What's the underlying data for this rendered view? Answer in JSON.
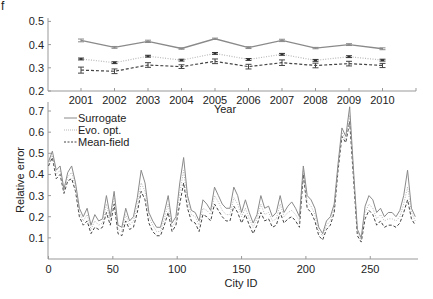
{
  "panel_letter": "f",
  "chart_data": [
    {
      "type": "line",
      "title": "",
      "xlabel": "Year",
      "ylabel": "",
      "ylim": [
        0.2,
        0.5
      ],
      "yticks": [
        "0.2",
        "0.3",
        "0.4",
        "0.5"
      ],
      "categories": [
        "2001",
        "2002",
        "2003",
        "2004",
        "2005",
        "2006",
        "2007",
        "2008",
        "2009",
        "2010"
      ],
      "grid": false,
      "error_bars": true,
      "series": [
        {
          "name": "Surrogate",
          "style": "solid",
          "color": "#8a8a8a",
          "values": [
            0.418,
            0.388,
            0.414,
            0.383,
            0.425,
            0.387,
            0.418,
            0.385,
            0.4,
            0.382
          ],
          "err": [
            0.006,
            0.004,
            0.005,
            0.003,
            0.003,
            0.004,
            0.005,
            0.003,
            0.004,
            0.004
          ]
        },
        {
          "name": "Evo. opt.",
          "style": "dotted",
          "color": "#b8b8b8",
          "values": [
            0.338,
            0.322,
            0.35,
            0.333,
            0.362,
            0.336,
            0.358,
            0.332,
            0.348,
            0.333
          ],
          "err": [
            0.004,
            0.004,
            0.004,
            0.004,
            0.004,
            0.004,
            0.004,
            0.004,
            0.004,
            0.004
          ]
        },
        {
          "name": "Mean-field",
          "style": "dashed",
          "color": "#444444",
          "values": [
            0.29,
            0.285,
            0.312,
            0.305,
            0.328,
            0.305,
            0.322,
            0.31,
            0.318,
            0.31
          ],
          "err": [
            0.013,
            0.01,
            0.01,
            0.008,
            0.01,
            0.01,
            0.012,
            0.01,
            0.01,
            0.009
          ]
        }
      ]
    },
    {
      "type": "line",
      "title": "",
      "xlabel": "City ID",
      "ylabel": "Relative error",
      "xlim": [
        0,
        287
      ],
      "ylim": [
        0,
        0.75
      ],
      "xticks": [
        "0",
        "50",
        "100",
        "150",
        "200",
        "250"
      ],
      "yticks": [
        "0.1",
        "0.2",
        "0.3",
        "0.4",
        "0.5",
        "0.6",
        "0.7"
      ],
      "grid": false,
      "legend_position": "upper left",
      "x": [
        0,
        3,
        6,
        9,
        12,
        15,
        18,
        21,
        24,
        27,
        30,
        33,
        36,
        39,
        42,
        45,
        48,
        51,
        54,
        57,
        60,
        63,
        66,
        69,
        72,
        75,
        78,
        81,
        84,
        87,
        90,
        93,
        96,
        99,
        102,
        105,
        108,
        111,
        114,
        117,
        120,
        123,
        126,
        129,
        132,
        135,
        138,
        141,
        144,
        147,
        150,
        153,
        156,
        159,
        162,
        165,
        168,
        171,
        174,
        177,
        180,
        183,
        186,
        189,
        192,
        195,
        198,
        201,
        204,
        207,
        210,
        213,
        216,
        219,
        222,
        225,
        228,
        231,
        234,
        237,
        240,
        243,
        246,
        249,
        252,
        255,
        258,
        261,
        264,
        267,
        270,
        273,
        276,
        279,
        282,
        285
      ],
      "series": [
        {
          "name": "Surrogate",
          "style": "solid",
          "color": "#8a8a8a",
          "values": [
            0.46,
            0.51,
            0.42,
            0.44,
            0.33,
            0.41,
            0.44,
            0.36,
            0.24,
            0.2,
            0.24,
            0.16,
            0.21,
            0.18,
            0.19,
            0.3,
            0.2,
            0.32,
            0.16,
            0.15,
            0.24,
            0.18,
            0.2,
            0.29,
            0.42,
            0.36,
            0.22,
            0.18,
            0.15,
            0.15,
            0.22,
            0.3,
            0.17,
            0.2,
            0.36,
            0.48,
            0.3,
            0.23,
            0.22,
            0.18,
            0.28,
            0.26,
            0.23,
            0.34,
            0.3,
            0.26,
            0.24,
            0.24,
            0.34,
            0.3,
            0.22,
            0.28,
            0.22,
            0.17,
            0.21,
            0.3,
            0.24,
            0.25,
            0.2,
            0.22,
            0.3,
            0.22,
            0.25,
            0.27,
            0.24,
            0.2,
            0.44,
            0.3,
            0.28,
            0.24,
            0.15,
            0.12,
            0.18,
            0.2,
            0.26,
            0.45,
            0.62,
            0.58,
            0.72,
            0.42,
            0.14,
            0.1,
            0.25,
            0.3,
            0.28,
            0.22,
            0.24,
            0.2,
            0.22,
            0.22,
            0.2,
            0.23,
            0.3,
            0.42,
            0.24,
            0.2
          ]
        },
        {
          "name": "Evo. opt.",
          "style": "dotted",
          "color": "#b8b8b8",
          "values": [
            0.45,
            0.49,
            0.4,
            0.42,
            0.32,
            0.39,
            0.41,
            0.34,
            0.22,
            0.18,
            0.21,
            0.14,
            0.18,
            0.16,
            0.17,
            0.26,
            0.18,
            0.29,
            0.14,
            0.13,
            0.21,
            0.16,
            0.18,
            0.25,
            0.36,
            0.32,
            0.2,
            0.16,
            0.13,
            0.13,
            0.19,
            0.26,
            0.15,
            0.18,
            0.31,
            0.42,
            0.27,
            0.21,
            0.2,
            0.16,
            0.24,
            0.23,
            0.21,
            0.3,
            0.27,
            0.23,
            0.21,
            0.21,
            0.29,
            0.26,
            0.2,
            0.24,
            0.19,
            0.15,
            0.19,
            0.26,
            0.21,
            0.22,
            0.18,
            0.19,
            0.26,
            0.2,
            0.22,
            0.23,
            0.21,
            0.18,
            0.42,
            0.27,
            0.25,
            0.21,
            0.13,
            0.11,
            0.16,
            0.18,
            0.24,
            0.44,
            0.6,
            0.56,
            0.68,
            0.4,
            0.13,
            0.09,
            0.22,
            0.26,
            0.24,
            0.19,
            0.21,
            0.18,
            0.19,
            0.19,
            0.18,
            0.2,
            0.26,
            0.34,
            0.22,
            0.18
          ]
        },
        {
          "name": "Mean-field",
          "style": "dashed",
          "color": "#444444",
          "values": [
            0.44,
            0.48,
            0.38,
            0.4,
            0.31,
            0.37,
            0.38,
            0.32,
            0.2,
            0.16,
            0.18,
            0.12,
            0.15,
            0.14,
            0.15,
            0.22,
            0.16,
            0.26,
            0.12,
            0.11,
            0.18,
            0.14,
            0.15,
            0.22,
            0.32,
            0.28,
            0.17,
            0.13,
            0.11,
            0.11,
            0.16,
            0.22,
            0.13,
            0.16,
            0.26,
            0.36,
            0.24,
            0.18,
            0.17,
            0.13,
            0.21,
            0.2,
            0.18,
            0.26,
            0.23,
            0.2,
            0.18,
            0.18,
            0.25,
            0.22,
            0.17,
            0.21,
            0.16,
            0.12,
            0.16,
            0.22,
            0.18,
            0.19,
            0.15,
            0.16,
            0.22,
            0.17,
            0.19,
            0.2,
            0.18,
            0.15,
            0.4,
            0.24,
            0.22,
            0.18,
            0.11,
            0.09,
            0.14,
            0.16,
            0.22,
            0.42,
            0.58,
            0.55,
            0.65,
            0.38,
            0.11,
            0.08,
            0.19,
            0.23,
            0.21,
            0.16,
            0.18,
            0.15,
            0.16,
            0.16,
            0.15,
            0.17,
            0.22,
            0.28,
            0.19,
            0.16
          ]
        }
      ]
    }
  ]
}
